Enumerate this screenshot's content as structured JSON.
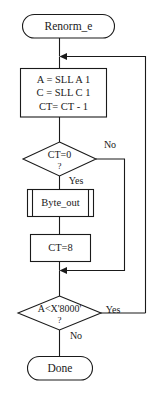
{
  "diagram": {
    "colors": {
      "stroke": "#1a1a1a",
      "fill": "#ffffff",
      "background": "#ffffff"
    },
    "nodes": {
      "start": {
        "type": "terminator",
        "label": "Renorm_e"
      },
      "shift_process": {
        "type": "process",
        "line1": "A = SLL A 1",
        "line2": "C = SLL C 1",
        "line3": "CT= CT - 1"
      },
      "ct_zero_decision": {
        "type": "decision",
        "condition": "CT=0",
        "question_mark": "?",
        "yes_label": "Yes",
        "no_label": "No"
      },
      "byte_out": {
        "type": "predefined-process",
        "label": "Byte_out"
      },
      "ct_reset": {
        "type": "process",
        "label": "CT=8"
      },
      "a_compare_decision": {
        "type": "decision",
        "condition": "A<X'8000'",
        "question_mark": "?",
        "yes_label": "Yes",
        "no_label": "No"
      },
      "end": {
        "type": "terminator",
        "label": "Done"
      }
    }
  }
}
